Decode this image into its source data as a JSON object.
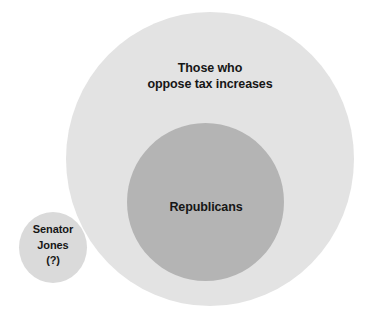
{
  "diagram": {
    "type": "euler-venn-nested-sets",
    "background_color": "#ffffff",
    "sets": {
      "outer": {
        "label": "Those who\noppose tax increases",
        "line1": "Those who",
        "line2": "oppose tax increases",
        "fill_color": "#e3e3e3",
        "shape": "circle"
      },
      "inner": {
        "label": "Republicans",
        "fill_color": "#b4b4b4",
        "shape": "circle",
        "relation": "subset-of-outer"
      },
      "individual": {
        "label": "Senator\nJones\n(?)",
        "line1": "Senator",
        "line2": "Jones",
        "line3": "(?)",
        "fill_color": "#dadada",
        "shape": "circle",
        "relation": "disjoint-from-outer"
      }
    },
    "text_color": "#161616"
  }
}
